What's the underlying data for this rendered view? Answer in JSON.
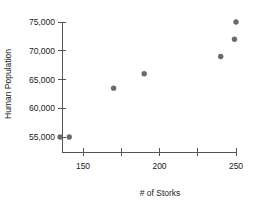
{
  "chart_data": {
    "type": "scatter",
    "title": "",
    "xlabel": "# of Storks",
    "ylabel": "Human Population",
    "xlim": [
      128,
      256
    ],
    "ylim": [
      53000,
      76500
    ],
    "grid": false,
    "legend": "none",
    "point_color": "#6b6b6b",
    "axis_color": "#555555",
    "x_ticks": [
      {
        "value": 150,
        "label": "150"
      },
      {
        "value": 175,
        "label": ""
      },
      {
        "value": 200,
        "label": "200"
      },
      {
        "value": 225,
        "label": ""
      },
      {
        "value": 250,
        "label": "250"
      }
    ],
    "y_ticks": [
      {
        "value": 55000,
        "label": "55,000"
      },
      {
        "value": 60000,
        "label": "60,000"
      },
      {
        "value": 65000,
        "label": "65,000"
      },
      {
        "value": 70000,
        "label": "70,000"
      },
      {
        "value": 75000,
        "label": "75,000"
      }
    ],
    "points": [
      {
        "x": 135,
        "y": 55000
      },
      {
        "x": 141,
        "y": 55000
      },
      {
        "x": 170,
        "y": 63500
      },
      {
        "x": 190,
        "y": 66000
      },
      {
        "x": 240,
        "y": 69000
      },
      {
        "x": 249,
        "y": 72000
      },
      {
        "x": 250,
        "y": 75000
      }
    ]
  }
}
